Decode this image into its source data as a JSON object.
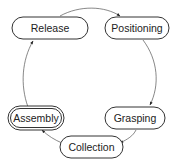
{
  "diagram": {
    "type": "cycle",
    "nodes": [
      {
        "id": "release",
        "label": "Release",
        "x": 12,
        "y": 17,
        "w": 76,
        "h": 22,
        "style": "single"
      },
      {
        "id": "positioning",
        "label": "Positioning",
        "x": 105,
        "y": 17,
        "w": 64,
        "h": 22,
        "style": "single"
      },
      {
        "id": "grasping",
        "label": "Grasping",
        "x": 105,
        "y": 107,
        "w": 60,
        "h": 22,
        "style": "single"
      },
      {
        "id": "collection",
        "label": "Collection",
        "x": 60,
        "y": 136,
        "w": 63,
        "h": 22,
        "style": "single"
      },
      {
        "id": "assembly",
        "label": "Assembly",
        "x": 10,
        "y": 107,
        "w": 54,
        "h": 22,
        "style": "double"
      }
    ],
    "edges": [
      {
        "from": "release",
        "to": "positioning"
      },
      {
        "from": "positioning",
        "to": "grasping"
      },
      {
        "from": "grasping",
        "to": "collection"
      },
      {
        "from": "collection",
        "to": "assembly"
      },
      {
        "from": "assembly",
        "to": "release"
      }
    ],
    "colors": {
      "stroke": "#333333",
      "text": "#222222",
      "background": "#ffffff"
    }
  }
}
